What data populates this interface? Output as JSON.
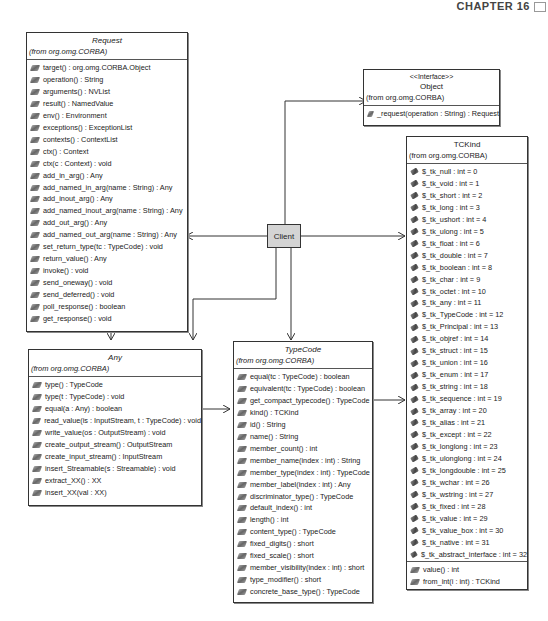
{
  "page_header": {
    "text": "CHAPTER 16"
  },
  "client": {
    "label": "Client"
  },
  "classes": {
    "request": {
      "name": "Request",
      "package": "(from org.omg.CORBA)",
      "operations": [
        "target() : org.omg.CORBA.Object",
        "operation() : String",
        "arguments() : NVList",
        "result() : NamedValue",
        "env() : Environment",
        "exceptions() : ExceptionList",
        "contexts() : ContextList",
        "ctx() : Context",
        "ctx(c : Context) : void",
        "add_in_arg() : Any",
        "add_named_in_arg(name : String) : Any",
        "add_inout_arg() : Any",
        "add_named_inout_arg(name : String) : Any",
        "add_out_arg() : Any",
        "add_named_out_arg(name : String) : Any",
        "set_return_type(tc : TypeCode) : void",
        "return_value() : Any",
        "invoke() : void",
        "send_oneway() : void",
        "send_deferred() : void",
        "poll_response() : boolean",
        "get_response() : void"
      ]
    },
    "any": {
      "name": "Any",
      "package": "(from org.omg.CORBA)",
      "operations": [
        "type() : TypeCode",
        "type(t : TypeCode) : void",
        "equal(a : Any) : boolean",
        "read_value(is : InputStream, t : TypeCode) : void",
        "write_value(os : OutputStream) : void",
        "create_output_stream() : OutputStream",
        "create_input_stream() : InputStream",
        "insert_Streamable(s : Streamable) : void",
        "extract_XX() : XX",
        "insert_XX(val : XX)"
      ]
    },
    "object": {
      "stereotype": "<<Interface>>",
      "name": "Object",
      "package": "(from org.omg.CORBA)",
      "operations": [
        "_request(operation : String) : Request"
      ]
    },
    "typecode": {
      "name": "TypeCode",
      "package": "(from org.omg.CORBA)",
      "operations": [
        "equal(tc : TypeCode) : boolean",
        "equivalent(tc : TypeCode) : boolean",
        "get_compact_typecode() : TypeCode",
        "kind() : TCKind",
        "id() : String",
        "name() : String",
        "member_count() : int",
        "member_name(index : int) : String",
        "member_type(index : int) : TypeCode",
        "member_label(index : int) : Any",
        "discriminator_type() : TypeCode",
        "default_index() : int",
        "length() : int",
        "content_type() : TypeCode",
        "fixed_digits() : short",
        "fixed_scale() : short",
        "member_visibility(index : int) : short",
        "type_modifier() : short",
        "concrete_base_type() : TypeCode"
      ]
    },
    "tckind": {
      "name": "TCKind",
      "package": "(from org.omg.CORBA)",
      "attributes": [
        "$_tk_null : int = 0",
        "$_tk_void : int = 1",
        "$_tk_short : int = 2",
        "$_tk_long : int = 3",
        "$_tk_ushort : int = 4",
        "$_tk_ulong : int = 5",
        "$_tk_float : int = 6",
        "$_tk_double : int = 7",
        "$_tk_boolean : int = 8",
        "$_tk_char : int = 9",
        "$_tk_octet : int = 10",
        "$_tk_any : int = 11",
        "$_tk_TypeCode : int = 12",
        "$_tk_Principal : int = 13",
        "$_tk_objref : int = 14",
        "$_tk_struct : int = 15",
        "$_tk_union : int = 16",
        "$_tk_enum : int = 17",
        "$_tk_string : int = 18",
        "$_tk_sequence : int = 19",
        "$_tk_array : int = 20",
        "$_tk_alias : int = 21",
        "$_tk_except : int = 22",
        "$_tk_longlong : int = 23",
        "$_tk_ulonglong : int = 24",
        "$_tk_longdouble : int = 25",
        "$_tk_wchar : int = 26",
        "$_tk_wstring : int = 27",
        "$_tk_fixed : int = 28",
        "$_tk_value : int = 29",
        "$_tk_value_box : int = 30",
        "$_tk_native : int = 31",
        "$_tk_abstract_interface : int = 32"
      ],
      "operations": [
        "value() : int",
        "from_int(i : int) : TCKind"
      ]
    }
  }
}
